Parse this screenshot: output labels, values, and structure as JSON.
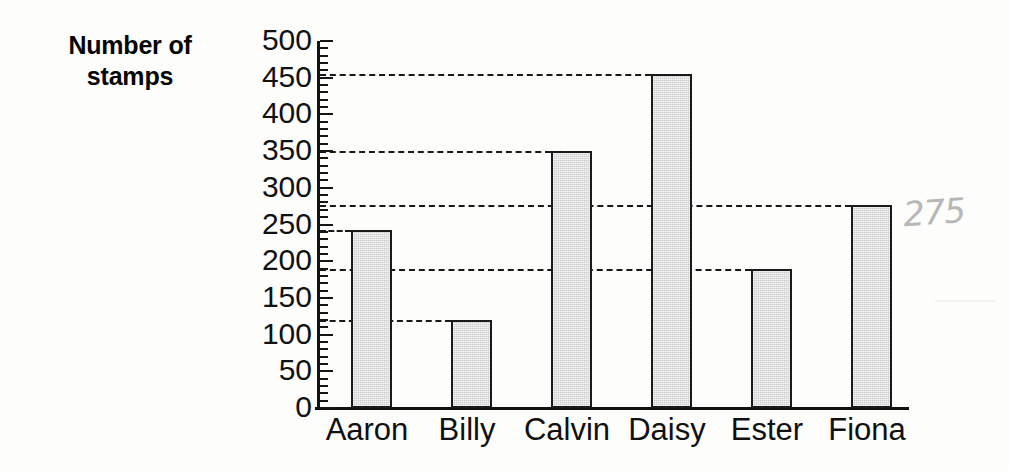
{
  "axis_caption": {
    "line1": "Number of",
    "line2": "stamps"
  },
  "annotation": {
    "handwritten_value": "275"
  },
  "chart_data": {
    "type": "bar",
    "title": "",
    "xlabel": "",
    "ylabel": "Number of stamps",
    "categories": [
      "Aaron",
      "Billy",
      "Calvin",
      "Daisy",
      "Ester",
      "Fiona"
    ],
    "values": [
      243,
      120,
      350,
      455,
      190,
      277
    ],
    "ylim": [
      0,
      500
    ],
    "y_major_tick_step": 50,
    "y_minor_tick_step": 10,
    "y_tick_labels": [
      "500",
      "450",
      "400",
      "350",
      "300",
      "250",
      "200",
      "150",
      "100",
      "50",
      "0"
    ],
    "y_tick_values": [
      500,
      450,
      400,
      350,
      300,
      250,
      200,
      150,
      100,
      50,
      0
    ],
    "grid": "horizontal dashed leader lines drawn from axis to the top of each bar",
    "gridline_values": [
      455,
      350,
      277,
      243,
      190,
      120
    ],
    "legend": null,
    "legend_position": "none",
    "bar_color": "#cbcbcb",
    "bar_edge_color": "#1a1a1a",
    "axis_color": "#121212",
    "background_color": "#fdfdfc",
    "annotation_color": "#b4b4b4",
    "annotations": [
      {
        "text": "275",
        "near_category": "Fiona",
        "style": "handwritten-pencil"
      }
    ]
  }
}
